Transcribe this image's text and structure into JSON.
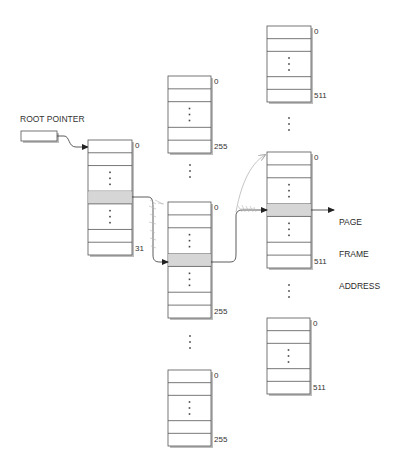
{
  "diagram": {
    "root_pointer_label": "ROOT POINTER",
    "page_frame_label_lines": [
      "PAGE",
      "FRAME",
      "ADDRESS"
    ],
    "colors": {
      "line": "#555555",
      "shade": "#d6d6d6",
      "box_fill": "#ffffff",
      "shadow": "#bdbdbd",
      "text": "#333333",
      "faint_arrow": "#aaaaaa"
    },
    "tables": [
      {
        "id": "level1",
        "x": 88,
        "y": 140,
        "w": 44,
        "h": 115,
        "first_index": "0",
        "last_index": "31",
        "shaded": true
      },
      {
        "id": "level2-top",
        "x": 168,
        "y": 76,
        "w": 43,
        "h": 77,
        "first_index": "0",
        "last_index": "255",
        "shaded": false
      },
      {
        "id": "level2-mid",
        "x": 168,
        "y": 202,
        "w": 43,
        "h": 116,
        "first_index": "0",
        "last_index": "255",
        "shaded": true
      },
      {
        "id": "level2-bot",
        "x": 168,
        "y": 370,
        "w": 43,
        "h": 76,
        "first_index": "0",
        "last_index": "255",
        "shaded": false
      },
      {
        "id": "level3-top",
        "x": 267,
        "y": 26,
        "w": 44,
        "h": 76,
        "first_index": "0",
        "last_index": "511",
        "shaded": false
      },
      {
        "id": "level3-mid",
        "x": 267,
        "y": 152,
        "w": 44,
        "h": 116,
        "first_index": "0",
        "last_index": "511",
        "shaded": true
      },
      {
        "id": "level3-bot",
        "x": 267,
        "y": 318,
        "w": 43,
        "h": 76,
        "first_index": "0",
        "last_index": "511",
        "shaded": false
      }
    ],
    "ellipses": [
      {
        "x": 190,
        "y": 165
      },
      {
        "x": 190,
        "y": 336
      },
      {
        "x": 289,
        "y": 118
      },
      {
        "x": 289,
        "y": 285
      }
    ]
  }
}
